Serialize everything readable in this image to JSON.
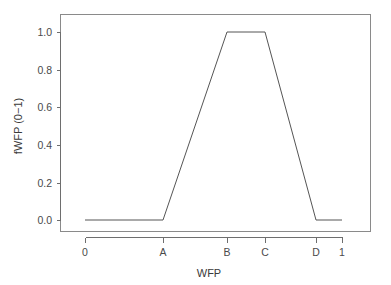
{
  "chart_data": {
    "type": "line",
    "title": "",
    "subtitle": "",
    "xlabel": "WFP",
    "ylabel": "fWFP (0−1)",
    "grid": false,
    "legend": null,
    "x_tick_labels": [
      "0",
      "A",
      "B",
      "C",
      "D",
      "1"
    ],
    "x_tick_positions": [
      0.0,
      0.25,
      0.46,
      0.58,
      0.75,
      0.83
    ],
    "y_tick_labels": [
      "0.0",
      "0.2",
      "0.4",
      "0.6",
      "0.8",
      "1.0"
    ],
    "y_tick_values": [
      0.0,
      0.2,
      0.4,
      0.6,
      0.8,
      1.0
    ],
    "xlim": [
      -0.06,
      1.0
    ],
    "ylim": [
      -0.04,
      1.09
    ],
    "series": [
      {
        "name": "fWFP membership",
        "points": [
          {
            "x_label": "0",
            "x": 0.0,
            "y": 0.0
          },
          {
            "x_label": "A",
            "x": 0.25,
            "y": 0.0
          },
          {
            "x_label": "B",
            "x": 0.46,
            "y": 1.0
          },
          {
            "x_label": "C",
            "x": 0.58,
            "y": 1.0
          },
          {
            "x_label": "D",
            "x": 0.75,
            "y": 0.0
          },
          {
            "x_label": "1",
            "x": 0.83,
            "y": 0.0
          }
        ]
      }
    ]
  },
  "axes": {
    "x_ticks": [
      {
        "label": "0",
        "px": 85
      },
      {
        "label": "A",
        "px": 163
      },
      {
        "label": "B",
        "px": 227
      },
      {
        "label": "C",
        "px": 265
      },
      {
        "label": "D",
        "px": 316
      },
      {
        "label": "1",
        "px": 342
      }
    ],
    "y_ticks": [
      {
        "label": "1.0",
        "px": 32
      },
      {
        "label": "0.8",
        "px": 70
      },
      {
        "label": "0.6",
        "px": 107
      },
      {
        "label": "0.4",
        "px": 145
      },
      {
        "label": "0.2",
        "px": 183
      },
      {
        "label": "0.0",
        "px": 220
      }
    ],
    "xlabel": "WFP",
    "ylabel": "fWFP (0−1)"
  },
  "colors": {
    "background": "#ffffff",
    "line": "#555555",
    "axis": "#6e6e6e",
    "box": "#8a8a8a",
    "text": "#3a3a3a"
  }
}
